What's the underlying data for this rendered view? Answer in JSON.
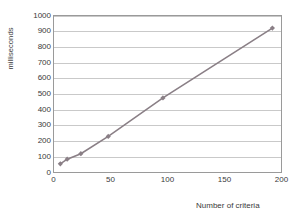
{
  "chart_data": {
    "type": "line",
    "title": "",
    "xlabel": "Number of criteria",
    "ylabel": "milliseconds",
    "xlim": [
      0,
      200
    ],
    "ylim": [
      0,
      1000
    ],
    "xticks": [
      0,
      50,
      100,
      150,
      200
    ],
    "yticks": [
      0,
      100,
      200,
      300,
      400,
      500,
      600,
      700,
      800,
      900,
      1000
    ],
    "xtick_labels": [
      "0",
      "50",
      "100",
      "150",
      "200"
    ],
    "ytick_labels": [
      "0",
      "100",
      "200",
      "300",
      "400",
      "500",
      "600",
      "700",
      "800",
      "900",
      "1000"
    ],
    "grid": {
      "horizontal": true,
      "vertical": false
    },
    "legend": {
      "visible": false,
      "position": "none"
    },
    "series": [
      {
        "name": "response time",
        "color": "#8a7f86",
        "marker": "diamond",
        "x": [
          6,
          12,
          24,
          48,
          96,
          192
        ],
        "y": [
          55,
          85,
          120,
          230,
          475,
          920
        ]
      }
    ]
  },
  "colors": {
    "line": "#8a7f86",
    "marker": "#8a7f86",
    "grid": "#c9c9c9",
    "axis": "#9a9a9a",
    "text": "#3a3a3a",
    "background": "#ffffff"
  }
}
